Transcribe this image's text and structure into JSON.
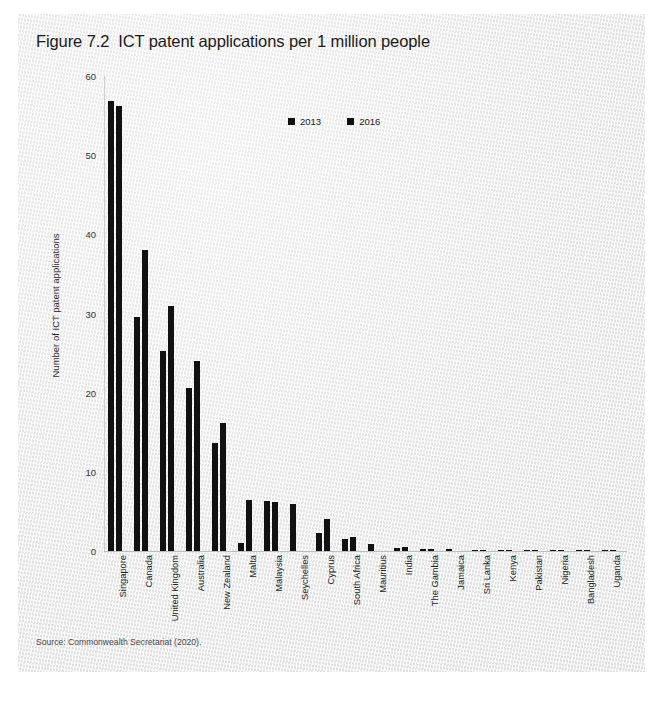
{
  "page": {
    "top_crumb": "",
    "source_note": "Source: Commonwealth Secretariat (2020)."
  },
  "chart_data": {
    "type": "bar",
    "title": "Figure 7.2  ICT patent applications per 1 million people",
    "xlabel": "",
    "ylabel": "Number of ICT patent applications",
    "ylim": [
      0,
      60
    ],
    "yticks": [
      0,
      10,
      20,
      30,
      40,
      50,
      60
    ],
    "grid": false,
    "legend_position": "top-center",
    "categories": [
      "Singapore",
      "Canada",
      "United Kingdom",
      "Australia",
      "New Zealand",
      "Malta",
      "Malaysia",
      "Seychelles",
      "Cyprus",
      "South Africa",
      "Mauritius",
      "India",
      "The Gambia",
      "Jamaica",
      "Sri Lanka",
      "Kenya",
      "Pakistan",
      "Nigeria",
      "Bangladesh",
      "Uganda"
    ],
    "series": [
      {
        "name": "2013",
        "color": "#111111",
        "values": [
          56.8,
          29.5,
          25.3,
          20.6,
          13.6,
          1.0,
          6.3,
          6.0,
          2.3,
          1.5,
          0.9,
          0.4,
          0.25,
          0.2,
          0.15,
          0.05,
          0.05,
          0.03,
          0.03,
          0.02
        ]
      },
      {
        "name": "2016",
        "color": "#111111",
        "values": [
          56.2,
          38.0,
          31.0,
          24.0,
          16.2,
          6.5,
          6.2,
          0.0,
          4.0,
          1.8,
          0.0,
          0.5,
          0.3,
          0.0,
          0.1,
          0.05,
          0.05,
          0.03,
          0.03,
          0.02
        ]
      }
    ]
  }
}
